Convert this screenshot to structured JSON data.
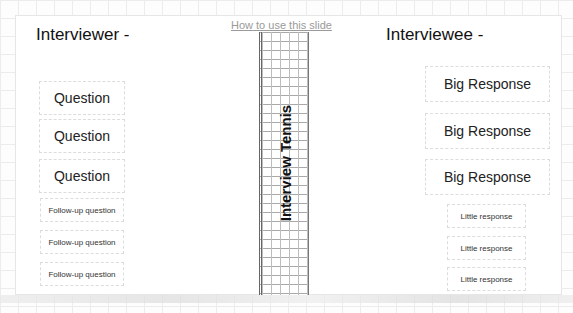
{
  "slide": {
    "help_link": "How to use this slide",
    "net_label": "Interview Tennis",
    "interviewer": {
      "heading": "Interviewer -",
      "questions": [
        "Question",
        "Question",
        "Question"
      ],
      "follow_ups": [
        "Follow-up question",
        "Follow-up question",
        "Follow-up question"
      ]
    },
    "interviewee": {
      "heading": "Interviewee -",
      "big_responses": [
        "Big Response",
        "Big Response",
        "Big Response"
      ],
      "little_responses": [
        "Little response",
        "Little response",
        "Little response"
      ]
    }
  }
}
